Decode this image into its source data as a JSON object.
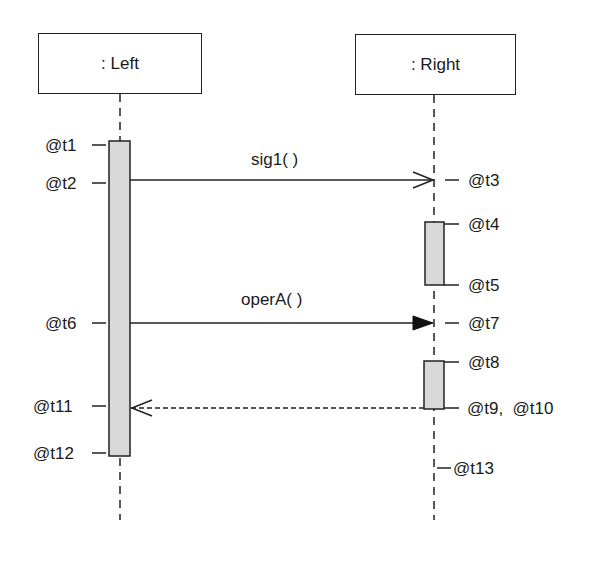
{
  "diagram": {
    "type": "uml-sequence-diagram",
    "lifelines": [
      {
        "id": "left",
        "label": ": Left"
      },
      {
        "id": "right",
        "label": ": Right"
      }
    ],
    "messages": [
      {
        "label": "sig1( )",
        "from": "left",
        "to": "right",
        "kind": "async-signal",
        "send_time": "@t2",
        "receive_time": "@t3"
      },
      {
        "label": "operA( )",
        "from": "left",
        "to": "right",
        "kind": "synchronous-call",
        "send_time": "@t6",
        "receive_time": "@t7"
      },
      {
        "label": "",
        "from": "right",
        "to": "left",
        "kind": "reply",
        "send_time": "@t10",
        "receive_time": "@t11"
      }
    ],
    "time_labels": {
      "t1": "@t1",
      "t2": "@t2",
      "t3": "@t3",
      "t4": "@t4",
      "t5": "@t5",
      "t6": "@t6",
      "t7": "@t7",
      "t8": "@t8",
      "t9_t10": "@t9,  @t10",
      "t11": "@t11",
      "t12": "@t12",
      "t13": "@t13"
    },
    "colors": {
      "line": "#222222",
      "activation_fill": "#d9d9d9",
      "background": "#ffffff"
    }
  }
}
